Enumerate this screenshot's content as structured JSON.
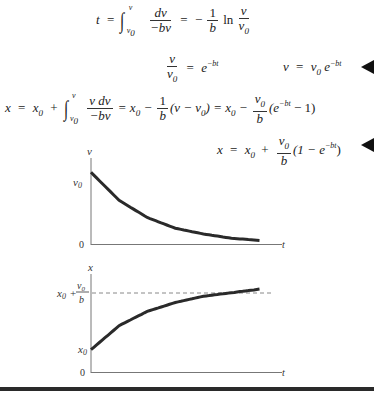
{
  "equations": {
    "eq1": {
      "lhs": "t",
      "eq": "=",
      "int_upper": "v",
      "int_lower": "v0",
      "frac_num": "dv",
      "frac_den": "−bv",
      "eq2": "=",
      "minus": "−",
      "coef_num": "1",
      "coef_den": "b",
      "ln": "ln",
      "ratio_num": "v",
      "ratio_den": "v0"
    },
    "eq2": {
      "frac_num": "v",
      "frac_den": "v0",
      "eq": "=",
      "rhs_base": "e",
      "rhs_exp": "−bt"
    },
    "eq3": {
      "lhs": "v",
      "eq": "=",
      "rhs": "v0",
      "rhs_base": "e",
      "rhs_exp": "−bt",
      "has_marker": true
    },
    "eq4": {
      "lhs": "x",
      "eq": "=",
      "x0": "x0",
      "plus": "+",
      "int_upper": "v",
      "int_lower": "v0",
      "frac_num": "v dv",
      "frac_den": "−bv",
      "part2": "= x0 −",
      "coef_num": "1",
      "coef_den": "b",
      "part3": "(v − v0) = x0 −",
      "coef2_num": "v0",
      "coef2_den": "b",
      "part4_base": "(e",
      "part4_exp": "−bt",
      "part4_tail": " − 1)"
    },
    "eq5": {
      "lhs": "x",
      "eq": "=",
      "x0": "x0",
      "plus": "+",
      "coef_num": "v0",
      "coef_den": "b",
      "tail_open": "(1 − e",
      "tail_exp": "−bt",
      "tail_close": ")",
      "has_marker": true
    }
  },
  "chart_data": [
    {
      "type": "line",
      "title": "",
      "xlabel": "t",
      "ylabel": "v",
      "yticks": [
        "0",
        "v0"
      ],
      "series": [
        {
          "name": "v(t) = v0 e^(−bt)",
          "function": "v0*exp(-b*t)",
          "x": [
            0,
            0.5,
            1,
            1.5,
            2,
            2.5,
            3
          ],
          "y": [
            1.0,
            0.61,
            0.37,
            0.22,
            0.14,
            0.08,
            0.05
          ]
        }
      ],
      "ylim": [
        0,
        1.2
      ],
      "xlim": [
        0,
        3.4
      ],
      "grid": false
    },
    {
      "type": "line",
      "title": "",
      "xlabel": "t",
      "ylabel": "x",
      "yticks": [
        "0",
        "x0",
        "x0 + v0/b"
      ],
      "asymptote": {
        "label": "x0 + v0/b",
        "style": "dashed",
        "value": 1.0
      },
      "series": [
        {
          "name": "x(t) = x0 + (v0/b)(1 − e^(−bt))",
          "function": "x0 + (v0/b)*(1-exp(-b*t))",
          "x": [
            0,
            0.5,
            1,
            1.5,
            2,
            2.5,
            3
          ],
          "y": [
            0.25,
            0.52,
            0.68,
            0.78,
            0.85,
            0.89,
            0.93
          ]
        }
      ],
      "ylim": [
        0,
        1.1
      ],
      "xlim": [
        0,
        3.4
      ],
      "grid": false
    }
  ]
}
